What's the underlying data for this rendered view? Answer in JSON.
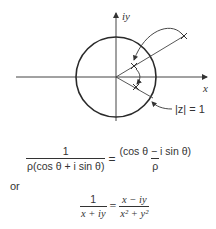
{
  "diagram": {
    "axis_labels": {
      "y": "iy",
      "x": "x"
    },
    "circle_label": "|z| = 1",
    "circle": {
      "cx": 116,
      "cy": 77,
      "r": 40
    },
    "points": {
      "outer": {
        "x": 184,
        "y": 36
      },
      "inverse": {
        "x": 134,
        "y": 66
      },
      "conjugate": {
        "x": 136,
        "y": 87
      }
    },
    "stroke_color": "#333333"
  },
  "equations": {
    "first": {
      "lhs_num": "1",
      "lhs_den": "ρ(cos θ + i sin θ)",
      "eq": "=",
      "rhs_num": "(cos θ − i sin θ)",
      "rhs_den": "ρ"
    },
    "connector": "or",
    "second": {
      "lhs_num": "1",
      "lhs_den": "x + iy",
      "eq": "=",
      "rhs_num": "x − iy",
      "rhs_den": "x² + y²"
    }
  }
}
